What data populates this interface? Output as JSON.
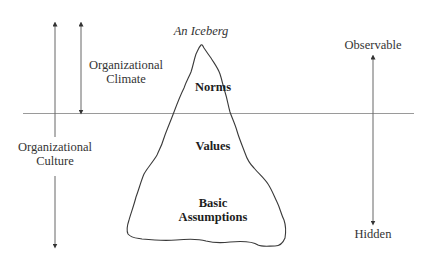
{
  "title": "An Iceberg",
  "left_labels": {
    "climate": [
      "Organizational",
      "Climate"
    ],
    "culture": [
      "Organizational",
      "Culture"
    ]
  },
  "right_labels": {
    "top": "Observable",
    "bottom": "Hidden"
  },
  "iceberg_layers": {
    "norms": "Norms",
    "values": "Values",
    "assumptions": [
      "Basic",
      "Assumptions"
    ]
  },
  "colors": {
    "line": "#8a8a8a",
    "outline": "#3a3a3a",
    "text": "#333333"
  }
}
